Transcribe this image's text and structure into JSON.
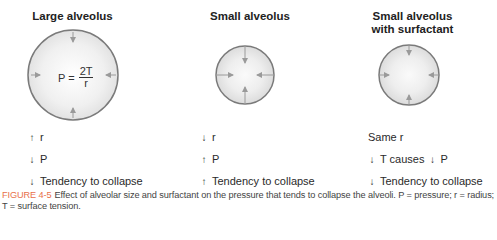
{
  "panels": [
    {
      "title": "Large alveolus",
      "formula": {
        "lhs": "P =",
        "numerator": "2T",
        "denominator": "r"
      },
      "effects": [
        {
          "arrow": "up",
          "text": "r"
        },
        {
          "arrow": "down",
          "text": "P"
        },
        {
          "arrow": "down",
          "text": "Tendency to collapse"
        }
      ]
    },
    {
      "title": "Small alveolus",
      "effects": [
        {
          "arrow": "down",
          "text": "r"
        },
        {
          "arrow": "up",
          "text": "P"
        },
        {
          "arrow": "up",
          "text": "Tendency to collapse"
        }
      ]
    },
    {
      "title_line1": "Small alveolus",
      "title_line2": "with surfactant",
      "effects": [
        {
          "arrow": "none",
          "text": "Same r"
        },
        {
          "arrow": "down",
          "text": "T causes",
          "arrow2": "down",
          "text2": "P"
        },
        {
          "arrow": "down",
          "text": "Tendency to collapse"
        }
      ]
    }
  ],
  "arrows": {
    "up": "↑",
    "down": "↓"
  },
  "caption": {
    "label": "FIGURE 4-5",
    "text": "Effect of alveolar size and surfactant on the pressure that tends to collapse the alveoli. P = pressure; r = radius; T = surface tension."
  },
  "colors": {
    "figure_label": "#e8704a",
    "circle_stroke": "#7a7a7a",
    "arrow": "#9a9a9a"
  }
}
